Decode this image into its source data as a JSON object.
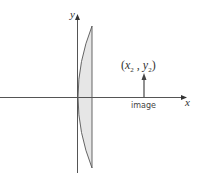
{
  "diagram": {
    "title": "",
    "axes": {
      "x_label": "x",
      "y_label": "y"
    },
    "lens": {
      "type": "plano-convex",
      "fill_color": "#e6e6e6",
      "stroke_color": "#555555"
    },
    "image_point": {
      "label_open": "(",
      "label_x": "x",
      "label_x_sub": "2",
      "label_sep": " , ",
      "label_y": "y",
      "label_y_sub": "2",
      "label_close": ")",
      "caption": "image"
    },
    "colors": {
      "axis": "#555555",
      "arrow": "#555555",
      "background": "#ffffff"
    }
  }
}
